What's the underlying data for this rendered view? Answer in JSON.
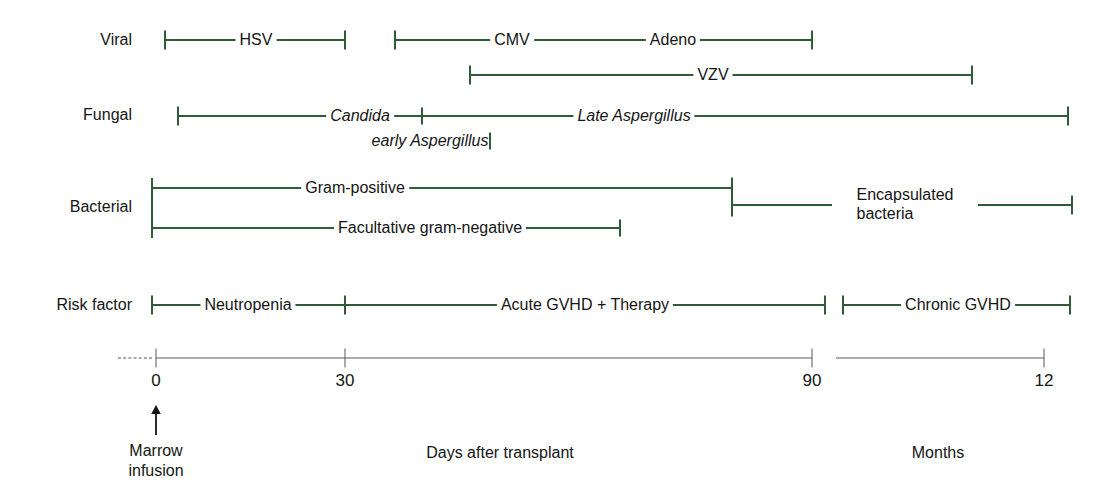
{
  "figure": {
    "type": "timeline",
    "accent_green": "#2f5b39",
    "axis_gray": "#58585a"
  },
  "row_labels": [
    {
      "id": "viral",
      "label": "Viral"
    },
    {
      "id": "fungal",
      "label": "Fungal"
    },
    {
      "id": "bacterial",
      "label": "Bacterial"
    },
    {
      "id": "risk_factor",
      "label": "Risk factor"
    }
  ],
  "axis": {
    "ticks": [
      {
        "value": "0",
        "x": 156
      },
      {
        "value": "30",
        "x": 345
      },
      {
        "value": "90",
        "x": 812
      },
      {
        "value": "12",
        "x": 1044
      }
    ],
    "captions": [
      {
        "id": "days",
        "text": "Days after transplant",
        "x": 500
      },
      {
        "id": "months",
        "text": "Months",
        "x": 938
      }
    ],
    "marrow_note": {
      "line1": "Marrow",
      "line2": "infusion",
      "x": 156
    }
  },
  "bands": {
    "viral": [
      {
        "id": "hsv",
        "label": "HSV",
        "italic": false,
        "start": 165,
        "end": 345,
        "label_x": 256
      },
      {
        "id": "cmv",
        "label": "CMV",
        "italic": false,
        "start": 395,
        "end": 812,
        "label_x": 512
      },
      {
        "id": "adeno",
        "label": "Adeno",
        "italic": false,
        "start": 395,
        "end": 812,
        "label_x": 673
      },
      {
        "id": "vzv",
        "label": "VZV",
        "italic": false,
        "start": 470,
        "end": 972,
        "label_x": 713
      }
    ],
    "fungal": [
      {
        "id": "candida",
        "label": "Candida",
        "italic": true,
        "start": 178,
        "end": 422,
        "label_x": 360
      },
      {
        "id": "early_aspergillus",
        "label": "early Aspergillus",
        "italic": true,
        "start": 360,
        "end": 490,
        "label_x": 360
      },
      {
        "id": "late_aspergillus",
        "label": "Late Aspergillus",
        "italic": true,
        "start": 422,
        "end": 1068,
        "label_x": 634
      }
    ],
    "bacterial": [
      {
        "id": "gram_positive",
        "label": "Gram-positive",
        "italic": false,
        "start": 152,
        "end": 732,
        "label_x": 355
      },
      {
        "id": "facultative_gram_negative",
        "label": "Facultative gram-negative",
        "italic": false,
        "start": 152,
        "end": 620,
        "label_x": 430
      },
      {
        "id": "encapsulated_bacteria",
        "label": "Encapsulated bacteria",
        "italic": false,
        "start": 732,
        "end": 1072,
        "label_x": 905
      }
    ],
    "risk_factor": [
      {
        "id": "neutropenia",
        "label": "Neutropenia",
        "italic": false,
        "start": 152,
        "end": 345,
        "label_x": 248
      },
      {
        "id": "acute_gvhd_therapy",
        "label": "Acute GVHD + Therapy",
        "italic": false,
        "start": 345,
        "end": 825,
        "label_x": 585
      },
      {
        "id": "chronic_gvhd",
        "label": "Chronic GVHD",
        "italic": false,
        "start": 843,
        "end": 1070,
        "label_x": 958
      }
    ]
  },
  "chart_data": {
    "type": "timeline",
    "xlabel": "Days after transplant / Months",
    "axis_ticks": [
      "0",
      "30",
      "90",
      "12"
    ],
    "axis_segments": [
      {
        "name": "Days after transplant",
        "from": "0",
        "to": "90"
      },
      {
        "name": "Months",
        "from": "3",
        "to": "12"
      }
    ],
    "rows": [
      {
        "category": "Viral",
        "items": [
          {
            "name": "HSV",
            "from_day": 0,
            "to_day": 30
          },
          {
            "name": "CMV",
            "from_day": 38,
            "to_day": 90
          },
          {
            "name": "Adeno",
            "from_day": 38,
            "to_day": 90
          },
          {
            "name": "VZV",
            "from_day": 50,
            "to_month": 8
          }
        ]
      },
      {
        "category": "Fungal",
        "items": [
          {
            "name": "Candida",
            "from_day": 3,
            "to_day": 42
          },
          {
            "name": "early Aspergillus",
            "from_day": 3,
            "to_day": 42
          },
          {
            "name": "Late Aspergillus",
            "from_day": 42,
            "to_month": 12
          }
        ]
      },
      {
        "category": "Bacterial",
        "items": [
          {
            "name": "Gram-positive",
            "from_day": 0,
            "to_day": 72
          },
          {
            "name": "Facultative gram-negative",
            "from_day": 0,
            "to_day": 72
          },
          {
            "name": "Encapsulated bacteria",
            "from_day": 72,
            "to_month": 12
          }
        ]
      },
      {
        "category": "Risk factor",
        "items": [
          {
            "name": "Neutropenia",
            "from_day": 0,
            "to_day": 30
          },
          {
            "name": "Acute GVHD + Therapy",
            "from_day": 30,
            "to_day": 90
          },
          {
            "name": "Chronic GVHD",
            "from_month": 3,
            "to_month": 12
          }
        ]
      }
    ]
  }
}
